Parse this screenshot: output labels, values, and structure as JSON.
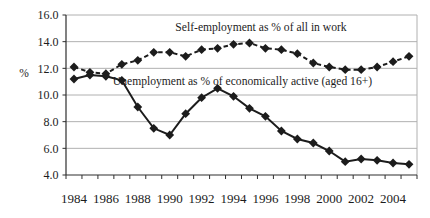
{
  "chart_data": {
    "type": "line",
    "title": "",
    "x": [
      1984,
      1985,
      1986,
      1987,
      1988,
      1989,
      1990,
      1991,
      1992,
      1993,
      1994,
      1995,
      1996,
      1997,
      1998,
      1999,
      2000,
      2001,
      2002,
      2003,
      2004,
      2005
    ],
    "x_axis": {
      "tick_labels": [
        "1984",
        "1986",
        "1988",
        "1990",
        "1992",
        "1994",
        "1996",
        "1998",
        "2000",
        "2002",
        "2004"
      ]
    },
    "y_axis": {
      "title": "%",
      "tick_labels": [
        "16.0",
        "14.0",
        "12.0",
        "10.0",
        "8.0",
        "6.0",
        "4.0"
      ],
      "min": 4.0,
      "max": 16.0,
      "step": 2.0
    },
    "grid": true,
    "legend_position": "inline-annotations",
    "series": [
      {
        "name": "Self-employment as % of all in work",
        "line_style": "dashed",
        "marker": "diamond",
        "color": "#1c1c1c",
        "values": [
          12.1,
          11.7,
          11.6,
          12.3,
          12.6,
          13.2,
          13.2,
          12.9,
          13.4,
          13.5,
          13.8,
          13.9,
          13.5,
          13.4,
          13.1,
          12.4,
          12.1,
          11.9,
          11.9,
          12.1,
          12.5,
          12.9
        ]
      },
      {
        "name": "Unemployment as % of economically active (aged 16+)",
        "line_style": "solid",
        "marker": "diamond",
        "color": "#1c1c1c",
        "values": [
          11.2,
          11.5,
          11.4,
          11.1,
          9.1,
          7.5,
          7.0,
          8.6,
          9.8,
          10.5,
          9.9,
          9.0,
          8.4,
          7.3,
          6.7,
          6.4,
          5.8,
          5.0,
          5.2,
          5.1,
          4.9,
          4.8
        ]
      }
    ],
    "colors": {
      "grid": "#b0b0b0",
      "axis": "#2e2e2e",
      "plot_border": "#b0b0b0",
      "text": "#1c1c1c"
    }
  }
}
